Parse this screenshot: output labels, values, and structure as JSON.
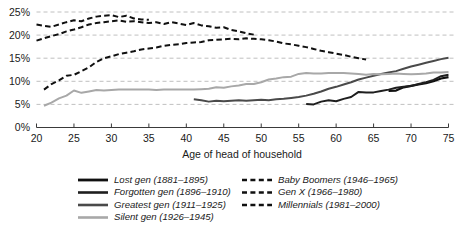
{
  "chart_data": {
    "type": "line",
    "title": "",
    "xlabel": "Age of head of household",
    "ylabel": "",
    "xlim": [
      20,
      75
    ],
    "ylim": [
      0,
      0.25
    ],
    "ylim_percent": [
      0,
      25
    ],
    "grid": true,
    "legend_position": "below",
    "xticks": [
      20,
      25,
      30,
      35,
      40,
      45,
      50,
      55,
      60,
      65,
      70,
      75
    ],
    "xtick_labels": [
      "20",
      "25",
      "30",
      "35",
      "40",
      "45",
      "50",
      "55",
      "60",
      "65",
      "70",
      "75"
    ],
    "yticks": [
      0,
      5,
      10,
      15,
      20,
      25
    ],
    "ytick_labels": [
      "0%",
      "5%",
      "10%",
      "15%",
      "20%",
      "25%"
    ],
    "series": [
      {
        "name": "Lost gen (1881–1895)",
        "style": "solid",
        "color": "#101010",
        "width": 2.2,
        "x": [
          67,
          68,
          69,
          70,
          71,
          72,
          73,
          74,
          75
        ],
        "values": [
          7.9,
          8.0,
          8.7,
          9.0,
          9.3,
          9.6,
          10.0,
          10.6,
          10.9
        ]
      },
      {
        "name": "Forgotten gen (1896–1910)",
        "style": "solid",
        "color": "#1e1e1e",
        "width": 2.0,
        "x": [
          56,
          57,
          58,
          59,
          60,
          61,
          62,
          63,
          64,
          65,
          66,
          67,
          68,
          69,
          70,
          71,
          72,
          73,
          74,
          75
        ],
        "values": [
          5.1,
          5.0,
          5.6,
          5.9,
          5.7,
          6.2,
          6.6,
          7.7,
          7.6,
          7.6,
          7.9,
          8.2,
          8.6,
          8.8,
          9.0,
          9.4,
          9.8,
          10.3,
          11.1,
          11.4
        ]
      },
      {
        "name": "Greatest gen (1911–1925)",
        "style": "solid",
        "color": "#4a4a4a",
        "width": 2.0,
        "x": [
          41,
          42,
          43,
          44,
          45,
          46,
          47,
          48,
          49,
          50,
          51,
          52,
          53,
          54,
          55,
          56,
          57,
          58,
          59,
          60,
          61,
          62,
          63,
          64,
          65,
          66,
          67,
          68,
          69,
          70,
          71,
          72,
          73,
          74,
          75
        ],
        "values": [
          6.1,
          5.9,
          5.6,
          5.8,
          5.7,
          5.8,
          5.9,
          5.8,
          5.9,
          6.0,
          5.9,
          6.1,
          6.2,
          6.4,
          6.6,
          6.9,
          7.3,
          7.8,
          8.4,
          8.8,
          9.3,
          9.8,
          10.4,
          10.8,
          11.2,
          11.6,
          11.9,
          12.2,
          12.7,
          13.2,
          13.6,
          14.0,
          14.4,
          14.8,
          15.1
        ]
      },
      {
        "name": "Silent gen (1926–1945)",
        "style": "solid",
        "color": "#a8a8a8",
        "width": 2.0,
        "x": [
          21,
          22,
          23,
          24,
          25,
          26,
          27,
          28,
          29,
          30,
          31,
          32,
          33,
          34,
          35,
          36,
          37,
          38,
          39,
          40,
          41,
          42,
          43,
          44,
          45,
          46,
          47,
          48,
          49,
          50,
          51,
          52,
          53,
          54,
          55,
          56,
          57,
          58,
          59,
          60,
          61,
          62,
          63,
          64,
          65,
          66,
          67,
          68,
          69,
          70,
          71,
          72,
          73,
          74,
          75
        ],
        "values": [
          4.7,
          5.4,
          6.3,
          6.9,
          8.0,
          7.5,
          7.8,
          8.1,
          8.0,
          8.1,
          8.2,
          8.2,
          8.2,
          8.2,
          8.2,
          8.1,
          8.2,
          8.2,
          8.2,
          8.2,
          8.2,
          8.3,
          8.4,
          8.7,
          8.6,
          8.9,
          9.1,
          9.4,
          9.4,
          9.8,
          10.4,
          10.6,
          10.9,
          11.0,
          11.6,
          11.8,
          11.7,
          11.7,
          11.8,
          11.8,
          11.8,
          11.7,
          11.6,
          11.4,
          11.6,
          11.5,
          11.6,
          11.7,
          11.6,
          11.5,
          11.6,
          11.7,
          11.9,
          11.9,
          12.0
        ]
      },
      {
        "name": "Baby Boomers (1946–1965)",
        "style": "dashed",
        "color": "#101010",
        "width": 2.0,
        "x": [
          21,
          22,
          23,
          24,
          25,
          26,
          27,
          28,
          29,
          30,
          31,
          32,
          33,
          34,
          35,
          36,
          37,
          38,
          39,
          40,
          41,
          42,
          43,
          44,
          45,
          46,
          47,
          48,
          49,
          50,
          51,
          52,
          53,
          54,
          55,
          56,
          57,
          58,
          59,
          60,
          61,
          62,
          63,
          64
        ],
        "values": [
          8.2,
          9.4,
          10.2,
          11.2,
          11.4,
          12.2,
          13.0,
          14.2,
          15.0,
          15.4,
          15.9,
          16.2,
          16.5,
          16.9,
          17.1,
          17.3,
          17.7,
          17.9,
          18.0,
          18.3,
          18.4,
          18.5,
          18.9,
          19.0,
          19.1,
          19.2,
          19.1,
          19.3,
          19.2,
          19.1,
          18.9,
          18.6,
          18.2,
          18.0,
          17.7,
          17.4,
          17.0,
          16.6,
          16.3,
          16.0,
          15.7,
          15.3,
          15.0,
          14.7
        ]
      },
      {
        "name": "Gen X (1966–1980)",
        "style": "dashed",
        "color": "#101010",
        "width": 2.0,
        "x": [
          20,
          21,
          22,
          23,
          24,
          25,
          26,
          27,
          28,
          29,
          30,
          31,
          32,
          33,
          34,
          35,
          36,
          37,
          38,
          39,
          40,
          41,
          42,
          43,
          44,
          45,
          46,
          47,
          48,
          49
        ],
        "values": [
          18.8,
          19.3,
          19.8,
          20.2,
          20.8,
          21.2,
          21.7,
          22.3,
          22.6,
          22.8,
          23.0,
          23.2,
          22.9,
          23.0,
          22.8,
          22.6,
          22.8,
          22.4,
          22.8,
          22.5,
          22.2,
          22.6,
          22.1,
          21.9,
          21.6,
          21.7,
          21.1,
          20.8,
          20.4,
          20.1
        ]
      },
      {
        "name": "Millennials (1981–2000)",
        "style": "dashed",
        "color": "#101010",
        "width": 2.0,
        "x": [
          20,
          21,
          22,
          23,
          24,
          25,
          26,
          27,
          28,
          29,
          30,
          31,
          32,
          33,
          34,
          35
        ],
        "values": [
          22.3,
          22.0,
          21.8,
          22.3,
          22.8,
          23.2,
          23.0,
          23.6,
          24.0,
          24.2,
          24.3,
          23.9,
          24.2,
          23.6,
          23.4,
          23.3
        ]
      }
    ]
  },
  "legend": {
    "left_column": [
      "Lost gen (1881–1895)",
      "Forgotten gen (1896–1910)",
      "Greatest gen (1911–1925)",
      "Silent gen (1926–1945)"
    ],
    "right_column": [
      "Baby Boomers (1946–1965)",
      "Gen X (1966–1980)",
      "Millennials (1981–2000)"
    ]
  },
  "colors": {
    "lost_gen": "#101010",
    "forgotten_gen": "#1e1e1e",
    "greatest_gen": "#4a4a4a",
    "silent_gen": "#a8a8a8",
    "dashed_generations": "#101010",
    "gridline": "#b9b9b9",
    "axis": "#3a3a3a",
    "background": "#ffffff"
  }
}
